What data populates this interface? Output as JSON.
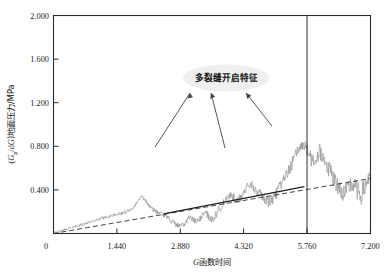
{
  "figure": {
    "background_color": "#ffffff",
    "frame_color": "#2b2b2b",
    "data_color": "#8c8c8c",
    "trend_color": "#303030",
    "annotation_bubble_color": "#efefef"
  },
  "annotation": {
    "label": "多裂缝开启特征",
    "arrow_count": 3
  },
  "axes": {
    "y_title_prefix": "(",
    "y_title_italic_1": "G",
    "y_title_sub_1": "p",
    "y_title_mid": "/d",
    "y_title_italic_2": "G",
    "y_title_suffix": ")地面压力/MPa",
    "x_title_italic": "G",
    "x_title_rest": "函数时间"
  },
  "chart_data": {
    "type": "line",
    "title": "",
    "xlabel": "G函数时间",
    "ylabel": "(Gp/dG)地面压力/MPa",
    "xlim": [
      0,
      7.2
    ],
    "ylim": [
      0,
      2.0
    ],
    "xticks": [
      0,
      1.44,
      2.88,
      4.32,
      5.76,
      7.2
    ],
    "xtick_labels": [
      "0",
      "1.440",
      "2.880",
      "4.320",
      "5.760",
      "7.200"
    ],
    "yticks": [
      0,
      0.4,
      0.8,
      1.2,
      1.6,
      2.0
    ],
    "ytick_labels": [
      "0",
      "0.400",
      "0.800",
      "1.200",
      "1.600",
      "2.000"
    ],
    "grid": false,
    "legend": false,
    "series": [
      {
        "name": "(Gp/dG) 地面压力 噪声曲线",
        "type": "line",
        "color": "#8c8c8c",
        "description": "从原点开始，随G函数时间近似线性上升并叠加逐渐增大的高频噪声，在5.760附近振幅最大，峰值约0.82 MPa",
        "x": [
          0.0,
          0.07,
          0.14,
          0.22,
          0.29,
          0.36,
          0.43,
          0.5,
          0.58,
          0.65,
          0.72,
          0.79,
          0.86,
          0.94,
          1.01,
          1.08,
          1.15,
          1.22,
          1.3,
          1.37,
          1.44,
          1.51,
          1.58,
          1.66,
          1.73,
          1.8,
          1.87,
          1.94,
          2.02,
          2.09,
          2.16,
          2.23,
          2.3,
          2.38,
          2.45,
          2.52,
          2.59,
          2.66,
          2.74,
          2.81,
          2.88,
          2.95,
          3.02,
          3.1,
          3.17,
          3.24,
          3.31,
          3.38,
          3.46,
          3.53,
          3.6,
          3.67,
          3.74,
          3.82,
          3.89,
          3.96,
          4.03,
          4.1,
          4.18,
          4.25,
          4.32,
          4.39,
          4.46,
          4.54,
          4.61,
          4.68,
          4.75,
          4.82,
          4.9,
          4.97,
          5.04,
          5.11,
          5.18,
          5.26,
          5.33,
          5.4,
          5.47,
          5.54,
          5.62,
          5.69,
          5.76,
          5.83,
          5.9,
          5.98,
          6.05,
          6.12,
          6.19,
          6.26,
          6.34,
          6.41,
          6.48,
          6.55,
          6.62,
          6.7,
          6.77,
          6.84,
          6.91,
          6.98,
          7.06,
          7.13,
          7.2
        ],
        "y": [
          0.005,
          0.012,
          0.02,
          0.03,
          0.038,
          0.045,
          0.055,
          0.062,
          0.07,
          0.082,
          0.09,
          0.1,
          0.11,
          0.118,
          0.128,
          0.136,
          0.146,
          0.152,
          0.162,
          0.168,
          0.175,
          0.182,
          0.188,
          0.2,
          0.215,
          0.238,
          0.27,
          0.31,
          0.345,
          0.3,
          0.262,
          0.23,
          0.205,
          0.19,
          0.175,
          0.168,
          0.15,
          0.12,
          0.095,
          0.075,
          0.06,
          0.075,
          0.11,
          0.15,
          0.125,
          0.095,
          0.12,
          0.165,
          0.19,
          0.15,
          0.12,
          0.155,
          0.205,
          0.25,
          0.29,
          0.32,
          0.35,
          0.325,
          0.3,
          0.33,
          0.38,
          0.41,
          0.44,
          0.42,
          0.39,
          0.36,
          0.33,
          0.3,
          0.28,
          0.31,
          0.35,
          0.4,
          0.45,
          0.5,
          0.56,
          0.62,
          0.68,
          0.74,
          0.8,
          0.82,
          0.76,
          0.7,
          0.64,
          0.69,
          0.75,
          0.7,
          0.64,
          0.58,
          0.52,
          0.46,
          0.42,
          0.38,
          0.35,
          0.4,
          0.45,
          0.42,
          0.38,
          0.34,
          0.4,
          0.48,
          0.56
        ]
      },
      {
        "name": "拟合直线（虚线）",
        "type": "line",
        "style": "dashed",
        "color": "#303030",
        "x": [
          0.0,
          7.2
        ],
        "y": [
          0.0,
          0.505
        ]
      },
      {
        "name": "切线（实线段）",
        "type": "line",
        "style": "solid",
        "color": "#1e1e1e",
        "x": [
          2.5,
          5.7
        ],
        "y": [
          0.18,
          0.43
        ]
      }
    ],
    "annotations": [
      {
        "text": "多裂缝开启特征",
        "x": 3.55,
        "y": 1.4,
        "arrows_to": [
          [
            2.2,
            0.78
          ],
          [
            3.0,
            0.75
          ],
          [
            4.15,
            0.88
          ]
        ]
      },
      {
        "text": "",
        "type": "vline",
        "x": 5.76,
        "color": "#2b2b2b"
      }
    ]
  }
}
